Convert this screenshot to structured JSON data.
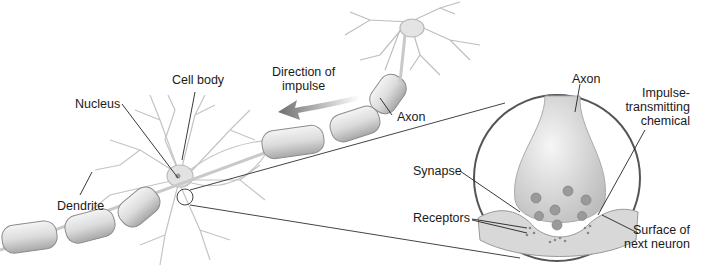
{
  "diagram": {
    "labels": {
      "cell_body": "Cell body",
      "nucleus": "Nucleus",
      "dendrite": "Dendrite",
      "direction_line1": "Direction of",
      "direction_line2": "impulse",
      "axon_main": "Axon",
      "axon_inset": "Axon",
      "impulse_line1": "Impulse-",
      "impulse_line2": "transmitting",
      "impulse_line3": "chemical",
      "synapse": "Synapse",
      "receptors": "Receptors",
      "surface_line1": "Surface of",
      "surface_line2": "next neuron"
    },
    "colors": {
      "stroke": "#3a3a3a",
      "fill_light": "#e6e6e6",
      "fill_mid": "#c8c8c8",
      "arrow": "#7a7a7a",
      "background": "#ffffff"
    }
  }
}
